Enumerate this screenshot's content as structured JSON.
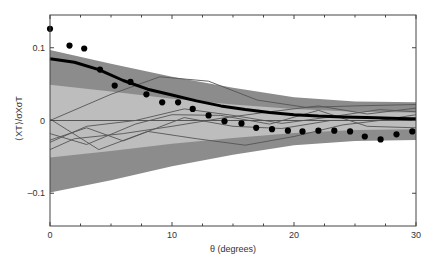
{
  "chart_data": {
    "type": "line",
    "title": "",
    "xlabel": "θ (degrees)",
    "ylabel": "⟨XT⟩/σXσT",
    "xlim": [
      0,
      30
    ],
    "ylim": [
      -0.145,
      0.145
    ],
    "grid": false,
    "legend": null,
    "x_ticks": [
      0,
      10,
      20,
      30
    ],
    "x_minor_ticks": [
      2.5,
      5,
      7.5,
      12.5,
      15,
      17.5,
      22.5,
      25,
      27.5
    ],
    "x_tick_labels": [
      "0",
      "10",
      "20",
      "30"
    ],
    "y_ticks": [
      0.1,
      0,
      -0.1
    ],
    "y_tick_labels": [
      "0.1",
      "0",
      "–0.1"
    ],
    "colors": {
      "outer_band": "#8c8c8c",
      "inner_band": "#bdbdbd",
      "model_line": "#000000",
      "sim_lines": "#555555",
      "zero_line": "#555555",
      "dots": "#000000"
    },
    "outer_band": {
      "x": [
        0,
        5,
        10,
        15,
        20,
        25,
        30
      ],
      "upper": [
        0.097,
        0.078,
        0.06,
        0.045,
        0.032,
        0.026,
        0.025
      ],
      "lower": [
        -0.099,
        -0.082,
        -0.063,
        -0.047,
        -0.034,
        -0.028,
        -0.027
      ]
    },
    "inner_band": {
      "x": [
        0,
        5,
        10,
        15,
        20,
        25,
        30
      ],
      "upper": [
        0.049,
        0.04,
        0.03,
        0.022,
        0.016,
        0.012,
        0.011
      ],
      "lower": [
        -0.051,
        -0.042,
        -0.032,
        -0.024,
        -0.017,
        -0.013,
        -0.012
      ]
    },
    "model_line": {
      "name": "Model",
      "x": [
        0,
        2,
        4,
        6,
        8,
        10,
        12,
        14,
        16,
        18,
        20,
        22,
        24,
        26,
        28,
        30
      ],
      "y": [
        0.085,
        0.08,
        0.07,
        0.055,
        0.043,
        0.035,
        0.027,
        0.02,
        0.015,
        0.011,
        0.008,
        0.006,
        0.005,
        0.004,
        0.003,
        0.002
      ]
    },
    "data_points": {
      "name": "Observed",
      "x": [
        0,
        1.6,
        2.8,
        4.1,
        5.3,
        6.6,
        7.9,
        9.2,
        10.5,
        11.7,
        13.0,
        14.3,
        15.7,
        16.9,
        18.2,
        19.5,
        20.7,
        22.0,
        23.3,
        24.6,
        25.8,
        27.1,
        28.4,
        29.7
      ],
      "y": [
        0.126,
        0.103,
        0.099,
        0.07,
        0.048,
        0.053,
        0.036,
        0.025,
        0.025,
        0.016,
        0.007,
        -0.001,
        -0.004,
        -0.01,
        -0.012,
        -0.014,
        -0.015,
        -0.014,
        -0.014,
        -0.015,
        -0.022,
        -0.026,
        -0.019,
        -0.015
      ]
    },
    "sim_lines": [
      {
        "name": "realization-1",
        "x": [
          0,
          5,
          9,
          13,
          17,
          21,
          25,
          30
        ],
        "y": [
          0.0,
          0.036,
          0.06,
          0.054,
          0.028,
          0.018,
          0.02,
          0.022
        ]
      },
      {
        "name": "realization-2",
        "x": [
          0,
          3,
          7,
          11,
          15,
          19,
          23,
          27,
          30
        ],
        "y": [
          -0.03,
          -0.008,
          0.0,
          0.016,
          0.007,
          -0.004,
          0.005,
          0.015,
          0.012
        ]
      },
      {
        "name": "realization-3",
        "x": [
          0,
          2,
          6,
          10,
          14,
          18,
          22,
          26,
          30
        ],
        "y": [
          -0.04,
          -0.025,
          -0.018,
          -0.008,
          0.003,
          0.012,
          0.02,
          0.009,
          0.017
        ]
      },
      {
        "name": "realization-4",
        "x": [
          0,
          3,
          7,
          10,
          14,
          18,
          22,
          26,
          30
        ],
        "y": [
          -0.018,
          -0.033,
          -0.005,
          0.008,
          0.007,
          -0.005,
          0.014,
          -0.008,
          -0.01
        ]
      },
      {
        "name": "realization-5",
        "x": [
          0,
          4,
          8,
          12,
          16,
          20,
          24,
          28,
          30
        ],
        "y": [
          0.002,
          -0.04,
          -0.015,
          -0.025,
          -0.034,
          -0.022,
          -0.006,
          0.002,
          0.004
        ]
      },
      {
        "name": "realization-6",
        "x": [
          0,
          3,
          6,
          11,
          15,
          19,
          23,
          27,
          30
        ],
        "y": [
          -0.027,
          -0.01,
          -0.028,
          0.004,
          -0.008,
          -0.011,
          0.0,
          0.0,
          0.008
        ]
      }
    ]
  }
}
